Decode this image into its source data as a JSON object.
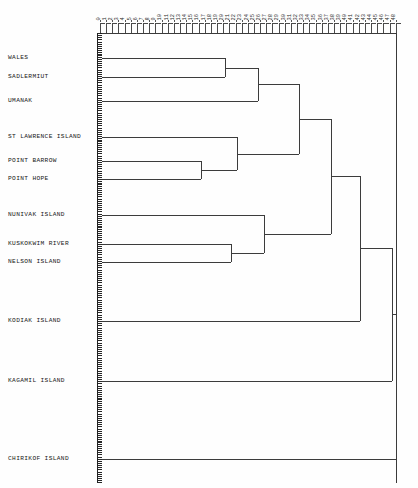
{
  "chart_data": {
    "type": "dendrogram",
    "title": "",
    "subtitle": "",
    "xlabel": "",
    "ylabel": "",
    "xlim": [
      0,
      48
    ],
    "grid": false,
    "legend": null,
    "orientation": "horizontal",
    "axis_top_tick_labels": [
      "0",
      "1",
      "2",
      "3",
      "4",
      "5",
      "6",
      "7",
      "8",
      "9",
      "10",
      "11",
      "12",
      "13",
      "14",
      "15",
      "16",
      "17",
      "18",
      "19",
      "20",
      "21",
      "22",
      "23",
      "24",
      "25",
      "26",
      "27",
      "28",
      "29",
      "30",
      "31",
      "32",
      "33",
      "34",
      "35",
      "36",
      "37",
      "38",
      "39",
      "40",
      "41",
      "42",
      "43",
      "44",
      "45",
      "46",
      "47",
      "48"
    ],
    "leaf_labels": [
      "WALES",
      "SADLERMIUT",
      "UMANAK",
      "ST LAWRENCE ISLAND",
      "POINT BARROW",
      "POINT HOPE",
      "NUNIVAK ISLAND",
      "KUSKOKWIM RIVER",
      "NELSON ISLAND",
      "KODIAK ISLAND",
      "KAGAMIL ISLAND",
      "CHIRIKOF ISLAND"
    ],
    "leaves": [
      {
        "label": "WALES",
        "y": 58
      },
      {
        "label": "SADLERMIUT",
        "y": 77
      },
      {
        "label": "UMANAK",
        "y": 101
      },
      {
        "label": "ST LAWRENCE ISLAND",
        "y": 137
      },
      {
        "label": "POINT BARROW",
        "y": 161
      },
      {
        "label": "POINT HOPE",
        "y": 179
      },
      {
        "label": "NUNIVAK ISLAND",
        "y": 215
      },
      {
        "label": "KUSKOKWIM RIVER",
        "y": 244
      },
      {
        "label": "NELSON ISLAND",
        "y": 262
      },
      {
        "label": "KODIAK ISLAND",
        "y": 321
      },
      {
        "label": "KAGAMIL ISLAND",
        "y": 381
      },
      {
        "label": "CHIRIKOF ISLAND",
        "y": 459
      }
    ],
    "merges": [
      {
        "id": "m1",
        "children": [
          "WALES",
          "SADLERMIUT"
        ],
        "x": 225,
        "y": 67.5,
        "distance": 20.5
      },
      {
        "id": "m2",
        "children": [
          "POINT BARROW",
          "POINT HOPE"
        ],
        "x": 201,
        "y": 170,
        "distance": 16.5
      },
      {
        "id": "m3",
        "children": [
          "m1",
          "UMANAK"
        ],
        "x": 258,
        "y": 84,
        "distance": 26.0
      },
      {
        "id": "m4",
        "children": [
          "ST LAWRENCE ISLAND",
          "m2"
        ],
        "x": 237,
        "y": 153.5,
        "distance": 22.5
      },
      {
        "id": "m5",
        "children": [
          "KUSKOKWIM RIVER",
          "NELSON ISLAND"
        ],
        "x": 231,
        "y": 253,
        "distance": 21.5
      },
      {
        "id": "m6",
        "children": [
          "m3",
          "m4"
        ],
        "x": 299,
        "y": 119,
        "distance": 32.5
      },
      {
        "id": "m7",
        "children": [
          "NUNIVAK ISLAND",
          "m5"
        ],
        "x": 264,
        "y": 234,
        "distance": 27.0
      },
      {
        "id": "m8",
        "children": [
          "m6",
          "m7"
        ],
        "x": 331,
        "y": 176,
        "distance": 38.0
      },
      {
        "id": "m9",
        "children": [
          "m8",
          "KODIAK ISLAND"
        ],
        "x": 360,
        "y": 248,
        "distance": 42.5
      },
      {
        "id": "m10",
        "children": [
          "m9",
          "KAGAMIL ISLAND"
        ],
        "x": 392,
        "y": 314,
        "distance": 48.0
      },
      {
        "id": "m11",
        "children": [
          "m10",
          "CHIRIKOF ISLAND"
        ],
        "x": 396,
        "y": 386,
        "distance": 48.5
      }
    ],
    "n_ticks": 49,
    "tick_x_start": 100,
    "tick_x_step": 6.16
  }
}
